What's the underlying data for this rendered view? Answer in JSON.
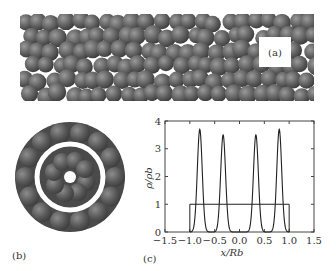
{
  "figure": {
    "panels": {
      "a": {
        "label": "(a)",
        "description": "side view of spheres confined in cylindrical tube"
      },
      "b": {
        "label": "(b)",
        "description": "cross-section view showing two concentric shells"
      },
      "c": {
        "label": "(c)"
      }
    }
  },
  "chart_data": {
    "type": "line",
    "title": "",
    "xlabel": "x/R_b",
    "ylabel": "ρ/ρ_b",
    "xlim": [
      -1.5,
      1.5
    ],
    "ylim": [
      0,
      4
    ],
    "xticks": [
      "-1.5",
      "-1.0",
      "-0.5",
      "0.0",
      "0.5",
      "1.0",
      "1.5"
    ],
    "yticks": [
      "0",
      "1",
      "2",
      "3",
      "4"
    ],
    "grid": false,
    "series": [
      {
        "name": "density profile",
        "peaks": [
          {
            "x": -0.8,
            "y": 3.7,
            "width": 0.07
          },
          {
            "x": -0.33,
            "y": 3.5,
            "width": 0.07
          },
          {
            "x": 0.33,
            "y": 3.5,
            "width": 0.07
          },
          {
            "x": 0.8,
            "y": 3.7,
            "width": 0.07
          }
        ]
      },
      {
        "name": "bulk step",
        "x": [
          -1.0,
          -1.0,
          1.0,
          1.0
        ],
        "y": [
          0,
          1,
          1,
          0
        ]
      }
    ]
  },
  "colors": {
    "sphere": "#5c5c5c",
    "sphere_highlight": "#8a8a8a",
    "line": "#222222",
    "axis": "#444444"
  }
}
